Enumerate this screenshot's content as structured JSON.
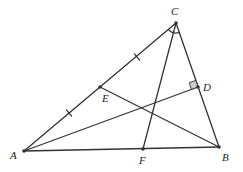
{
  "diagram": {
    "type": "triangle-geometry",
    "points": {
      "A": {
        "label": "A",
        "x": 24,
        "y": 151,
        "lx": 10,
        "ly": 159
      },
      "B": {
        "label": "B",
        "x": 219,
        "y": 147,
        "lx": 222,
        "ly": 161
      },
      "C": {
        "label": "C",
        "x": 176,
        "y": 23,
        "lx": 171,
        "ly": 15
      },
      "D": {
        "label": "D",
        "x": 198,
        "y": 87,
        "lx": 203,
        "ly": 91
      },
      "E": {
        "label": "E",
        "x": 100,
        "y": 87,
        "lx": 102,
        "ly": 102
      },
      "F": {
        "label": "F",
        "x": 143,
        "y": 149,
        "lx": 139,
        "ly": 164
      }
    },
    "segments": [
      [
        "A",
        "B"
      ],
      [
        "A",
        "C"
      ],
      [
        "B",
        "C"
      ],
      [
        "A",
        "D"
      ],
      [
        "B",
        "E"
      ],
      [
        "C",
        "F"
      ]
    ],
    "equal_ticks": [
      {
        "on": "AE",
        "x": 69,
        "y": 113
      },
      {
        "on": "EC",
        "x": 137,
        "y": 57
      }
    ],
    "angle_mark": {
      "vertex": "C",
      "between": [
        "A",
        "F"
      ]
    },
    "right_angle": {
      "vertex": "D",
      "fill": "#cccccc"
    },
    "line_color": "#333333"
  }
}
